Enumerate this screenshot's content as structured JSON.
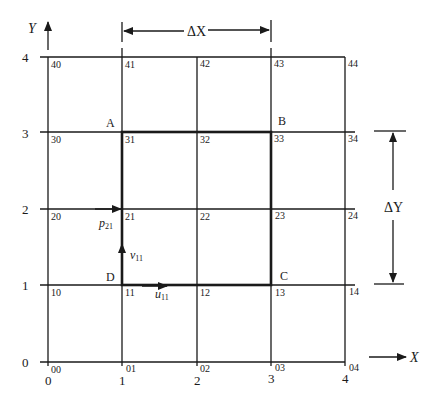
{
  "diagram": {
    "axes": {
      "x_label": "X",
      "y_label": "Y",
      "x_ticks": [
        "0",
        "1",
        "2",
        "3",
        "4"
      ],
      "y_ticks": [
        "0",
        "1",
        "2",
        "3",
        "4"
      ]
    },
    "dimensions": {
      "dx_label": "ΔX",
      "dy_label": "ΔY"
    },
    "nodes": {
      "row4": [
        "40",
        "41",
        "42",
        "43",
        "44"
      ],
      "row3": [
        "30",
        "31",
        "32",
        "33",
        "34"
      ],
      "row2": [
        "20",
        "21",
        "22",
        "23",
        "24"
      ],
      "row1": [
        "10",
        "11",
        "12",
        "13",
        "14"
      ],
      "row0": [
        "00",
        "01",
        "02",
        "03",
        "04"
      ]
    },
    "corners": {
      "A": "A",
      "B": "B",
      "C": "C",
      "D": "D"
    },
    "variables": {
      "p": {
        "base": "p",
        "sub": "21"
      },
      "v": {
        "base": "v",
        "sub": "11"
      },
      "u": {
        "base": "u",
        "sub": "11"
      }
    },
    "colors": {
      "line": "#1a1a1a",
      "background": "#ffffff"
    }
  }
}
